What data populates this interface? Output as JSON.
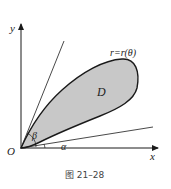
{
  "figure": {
    "caption": "图 21–28",
    "curve_label": "r=r(θ)",
    "region_label": "D",
    "origin_label": "O",
    "x_axis_label": "x",
    "y_axis_label": "y",
    "angle_alpha_label": "α",
    "angle_beta_label": "β"
  },
  "colors": {
    "region_fill": "#c8c8c8",
    "stroke": "#1a1a1a",
    "background": "#ffffff"
  }
}
